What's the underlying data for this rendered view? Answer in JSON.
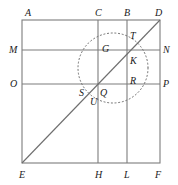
{
  "figure": {
    "colors": {
      "line": "#7d7d7d",
      "diagonal": "#6e6e6e",
      "circle": "#6e6e6e",
      "label": "#1a1a1a",
      "background": "#ffffff"
    },
    "square": {
      "left": 22,
      "top": 20,
      "right": 160,
      "bottom": 163
    },
    "grid": {
      "vertical_lines_x": [
        98,
        127
      ],
      "horizontal_lines_y": [
        50,
        84
      ]
    },
    "diagonal": {
      "from": "E",
      "to": "D",
      "x1": 22,
      "y1": 163,
      "x2": 160,
      "y2": 20
    },
    "circle": {
      "cx": 113,
      "cy": 68,
      "r": 35,
      "style": "dotted"
    },
    "labels": [
      {
        "text": "A",
        "x": 25,
        "y": 8,
        "name": "point-label-a"
      },
      {
        "text": "C",
        "x": 95,
        "y": 8,
        "name": "point-label-c"
      },
      {
        "text": "B",
        "x": 124,
        "y": 8,
        "name": "point-label-b"
      },
      {
        "text": "D",
        "x": 155,
        "y": 8,
        "name": "point-label-d"
      },
      {
        "text": "M",
        "x": 9,
        "y": 45,
        "name": "point-label-m"
      },
      {
        "text": "N",
        "x": 163,
        "y": 45,
        "name": "point-label-n"
      },
      {
        "text": "O",
        "x": 10,
        "y": 79,
        "name": "point-label-o"
      },
      {
        "text": "P",
        "x": 163,
        "y": 79,
        "name": "point-label-p"
      },
      {
        "text": "E",
        "x": 19,
        "y": 170,
        "name": "point-label-e"
      },
      {
        "text": "H",
        "x": 95,
        "y": 170,
        "name": "point-label-h"
      },
      {
        "text": "L",
        "x": 124,
        "y": 170,
        "name": "point-label-l"
      },
      {
        "text": "F",
        "x": 155,
        "y": 170,
        "name": "point-label-f"
      },
      {
        "text": "T",
        "x": 130,
        "y": 31,
        "name": "point-label-t"
      },
      {
        "text": "G",
        "x": 102,
        "y": 44,
        "name": "point-label-g"
      },
      {
        "text": "K",
        "x": 130,
        "y": 56,
        "name": "point-label-k"
      },
      {
        "text": "R",
        "x": 130,
        "y": 76,
        "name": "point-label-r"
      },
      {
        "text": "S",
        "x": 79,
        "y": 88,
        "name": "point-label-s"
      },
      {
        "text": "Q",
        "x": 100,
        "y": 88,
        "name": "point-label-q"
      },
      {
        "text": "U",
        "x": 90,
        "y": 97,
        "name": "point-label-u"
      }
    ]
  }
}
